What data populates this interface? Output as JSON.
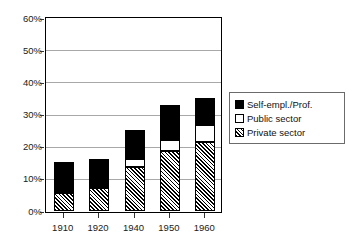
{
  "chart_data": {
    "type": "bar",
    "stacked": true,
    "title": "",
    "subtitle": "",
    "xlabel": "",
    "ylabel": "",
    "categories": [
      "1910",
      "1920",
      "1940",
      "1950",
      "1960"
    ],
    "series": [
      {
        "name": "Private sector",
        "values": [
          5.6,
          7.1,
          13.6,
          18.6,
          21.3
        ]
      },
      {
        "name": "Public sector",
        "values": [
          0.0,
          0.0,
          2.5,
          3.4,
          5.3
        ]
      },
      {
        "name": "Self-empl./Prof.",
        "values": [
          9.6,
          9.0,
          9.0,
          10.8,
          8.4
        ]
      }
    ],
    "totals": [
      15.2,
      16.1,
      25.1,
      32.8,
      35.0
    ],
    "ylim": [
      0,
      60
    ],
    "yticks": [
      0,
      10,
      20,
      30,
      40,
      50,
      60
    ],
    "ytick_labels": [
      "0%",
      "10%",
      "20%",
      "30%",
      "40%",
      "50%",
      "60%"
    ],
    "grid": true,
    "grid_axis": "y",
    "legend_position": "right",
    "colors": {
      "self_employed": "#000000",
      "public_sector": "#ffffff",
      "private_sector_hatch_ink": "#000000",
      "private_sector_hatch_bg": "#ffffff",
      "gridline": "#a8a8a8",
      "axis": "#000000",
      "text": "#1a1a1a",
      "legend_border": "#6b6b6b"
    }
  },
  "legend": {
    "items": [
      {
        "label": "Self-empl./Prof.",
        "swatch": "filled-black-square-icon"
      },
      {
        "label": "Public sector",
        "swatch": "empty-white-square-icon"
      },
      {
        "label": "Private sector",
        "swatch": "hatched-square-icon"
      }
    ]
  }
}
